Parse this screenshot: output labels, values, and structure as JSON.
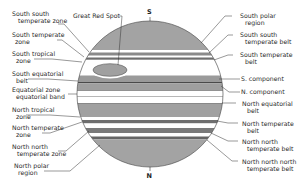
{
  "diagram": {
    "poles": {
      "south": "S",
      "north": "N"
    },
    "colors": {
      "belt_gray": "#9a9a9a",
      "polar_gray": "#a3a3a3",
      "dark_band": "#6e6e6e",
      "zone_white": "#ffffff",
      "outline": "#555555",
      "line": "#333333"
    },
    "feature_label": "Great Red Spot",
    "left_labels": [
      {
        "line1": "South south",
        "line2": "temperate zone"
      },
      {
        "line1": "South temperate",
        "line2": "zone"
      },
      {
        "line1": "South tropical",
        "line2": "zone"
      },
      {
        "line1": "South equatorial",
        "line2": "belt"
      },
      {
        "line1": "Equatorial zone",
        "line2": "equatorial band"
      },
      {
        "line1": "North tropical",
        "line2": "zone"
      },
      {
        "line1": "North temperate",
        "line2": "zone"
      },
      {
        "line1": "North north",
        "line2": "temperate zone"
      },
      {
        "line1": "North polar",
        "line2": "region"
      }
    ],
    "right_labels": [
      {
        "line1": "South polar",
        "line2": "region"
      },
      {
        "line1": "South south",
        "line2": "temperate belt"
      },
      {
        "line1": "South temperate",
        "line2": "belt"
      },
      {
        "line1": "S. component",
        "line2": ""
      },
      {
        "line1": "N. component",
        "line2": ""
      },
      {
        "line1": "North equatorial",
        "line2": "belt"
      },
      {
        "line1": "North temperate",
        "line2": "belt"
      },
      {
        "line1": "North north",
        "line2": "temperate belt"
      },
      {
        "line1": "North north north",
        "line2": "temperate belt"
      }
    ]
  }
}
